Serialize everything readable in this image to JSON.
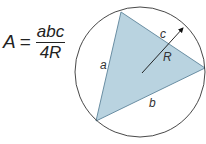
{
  "formula": {
    "lhs": "A",
    "equals": "=",
    "numerator": "abc",
    "denominator": "4R"
  },
  "diagram": {
    "circle": {
      "cx": 140,
      "cy": 72,
      "r": 65,
      "stroke": "#333333"
    },
    "triangle": {
      "points": "121,12 205,68 96,121",
      "fill": "#b9d3e0",
      "stroke": "#6a8ea3"
    },
    "radius_line": {
      "x1": 142,
      "y1": 73,
      "x2": 184,
      "y2": 27,
      "stroke": "#111111"
    },
    "labels": {
      "a": "a",
      "b": "b",
      "c": "c",
      "R": "R"
    }
  }
}
